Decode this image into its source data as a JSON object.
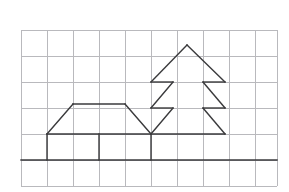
{
  "figure": {
    "title": "Line drawing of a house and a fir tree on a square grid",
    "canvas": {
      "width": 289,
      "height": 192,
      "background": "#ffffff"
    },
    "grid": {
      "label": "square grid background",
      "color": "#b9b9bd",
      "stroke_width": 1,
      "cell_size": 26,
      "x_lines": [
        21,
        47,
        73,
        99,
        125,
        151,
        177,
        203,
        229,
        255,
        277
      ],
      "y_lines": [
        30,
        56,
        82,
        108,
        134,
        160,
        186
      ],
      "x_start": 21,
      "x_end": 277,
      "y_start": 30,
      "y_end": 186
    },
    "drawing": {
      "color": "#3a3a3c",
      "stroke_width": 1.4,
      "ground": {
        "label": "ground line",
        "points": "21,160 277,160"
      },
      "house": {
        "label": "house outline",
        "left_wall": "47,160 47,134",
        "middle_wall": "99,160 99,134",
        "right_wall": "151,160 151,134",
        "floor_line": "47,134 151,134",
        "roof_left_slope": "47,134 73,104",
        "roof_ridge": "73,104 125,104",
        "roof_right_slope": "125,104 151,134"
      },
      "tree": {
        "label": "fir tree outline",
        "top_left_slope": "187,45 151,82",
        "top_right_slope": "187,45 225,82",
        "tier1_left_bar": "151,82 173,82",
        "tier1_right_bar": "203,82 225,82",
        "tier1_left_inner": "173,82 151,108",
        "tier1_right_inner": "203,82 225,108",
        "tier2_left_bar": "151,108 173,108",
        "tier2_right_bar": "203,108 225,108",
        "tier2_left_inner": "173,108 151,134",
        "tier2_right_inner": "203,108 225,134",
        "base_bar": "151,134 225,134"
      }
    }
  }
}
